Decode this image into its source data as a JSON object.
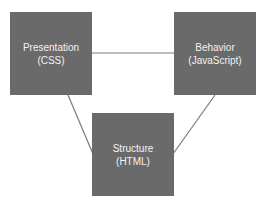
{
  "nodes": [
    {
      "id": "presentation",
      "title": "Presentation",
      "subtitle": "(CSS)"
    },
    {
      "id": "behavior",
      "title": "Behavior",
      "subtitle": "(JavaScript)"
    },
    {
      "id": "structure",
      "title": "Structure",
      "subtitle": "(HTML)"
    }
  ],
  "edges": [
    {
      "from": "presentation",
      "to": "behavior"
    },
    {
      "from": "presentation",
      "to": "structure"
    },
    {
      "from": "behavior",
      "to": "structure"
    }
  ],
  "colors": {
    "box": "#6a6a6a",
    "text": "#f2f2f2",
    "line": "#7a7a7a"
  }
}
